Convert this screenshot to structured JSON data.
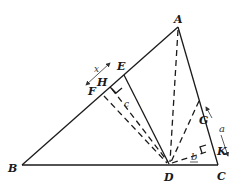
{
  "diagram": {
    "type": "geometry-triangle",
    "points": {
      "A": "A",
      "B": "B",
      "C": "C",
      "D": "D",
      "E": "E",
      "F": "F",
      "G": "G",
      "H": "H",
      "K": "K"
    },
    "measures": {
      "x": "x",
      "a": "a",
      "b": "b",
      "c": "c"
    },
    "segments": {
      "solid": [
        "AB",
        "BC",
        "CA",
        "ED"
      ],
      "dashed": [
        "AD",
        "GD",
        "HD",
        "FD",
        "DK"
      ]
    },
    "right_angles": [
      "H",
      "K"
    ]
  }
}
